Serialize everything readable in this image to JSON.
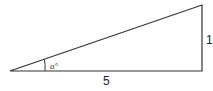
{
  "diagram": {
    "type": "right-triangle",
    "base_label": "5",
    "height_label": "1",
    "angle_label": "a°",
    "line_color": "#333333"
  }
}
